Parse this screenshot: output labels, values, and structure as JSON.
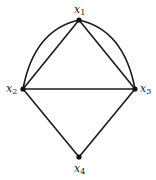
{
  "diagram": {
    "type": "graph",
    "nodes": [
      {
        "id": "x1",
        "label": "x",
        "sub": "1",
        "x": 79,
        "y": 20
      },
      {
        "id": "x2",
        "label": "x",
        "sub": "2",
        "x": 23,
        "y": 89
      },
      {
        "id": "x3",
        "label": "x",
        "sub": "3",
        "x": 135,
        "y": 89
      },
      {
        "id": "x4",
        "label": "x",
        "sub": "4",
        "x": 79,
        "y": 157
      }
    ],
    "edges": [
      {
        "from": "x1",
        "to": "x2",
        "style": "straight"
      },
      {
        "from": "x1",
        "to": "x2",
        "style": "curved"
      },
      {
        "from": "x1",
        "to": "x3",
        "style": "straight"
      },
      {
        "from": "x1",
        "to": "x3",
        "style": "curved"
      },
      {
        "from": "x2",
        "to": "x3",
        "style": "straight"
      },
      {
        "from": "x2",
        "to": "x4",
        "style": "straight"
      },
      {
        "from": "x3",
        "to": "x4",
        "style": "straight"
      }
    ],
    "colors": {
      "line": "#1a1a1a",
      "node": "#111111",
      "background": "#ffffff"
    }
  }
}
